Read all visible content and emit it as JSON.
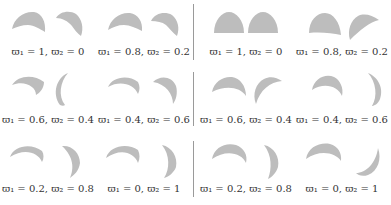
{
  "figure": {
    "shape_color": "#bdbdbd",
    "divider_color": "#9a9a9a",
    "panels": [
      {
        "name": "left",
        "cells": [
          {
            "label": "ϖ₁ = 1, ϖ₂ = 0"
          },
          {
            "label": "ϖ₁ = 0.8, ϖ₂ = 0.2"
          },
          {
            "label": "ϖ₁ = 0.6, ϖ₂ = 0.4"
          },
          {
            "label": "ϖ₁ = 0.4, ϖ₂ = 0.6"
          },
          {
            "label": "ϖ₁ = 0.2, ϖ₂ = 0.8"
          },
          {
            "label": "ϖ₁ = 0, ϖ₂ = 1"
          }
        ]
      },
      {
        "name": "right",
        "cells": [
          {
            "label": "ϖ₁ = 1, ϖ₂ = 0"
          },
          {
            "label": "ϖ₁ = 0.8, ϖ₂ = 0.2"
          },
          {
            "label": "ϖ₁ = 0.6, ϖ₂ = 0.4"
          },
          {
            "label": "ϖ₁ = 0.4, ϖ₂ = 0.6"
          },
          {
            "label": "ϖ₁ = 0.2, ϖ₂ = 0.8"
          },
          {
            "label": "ϖ₁ = 0, ϖ₂ = 1"
          }
        ]
      }
    ]
  }
}
